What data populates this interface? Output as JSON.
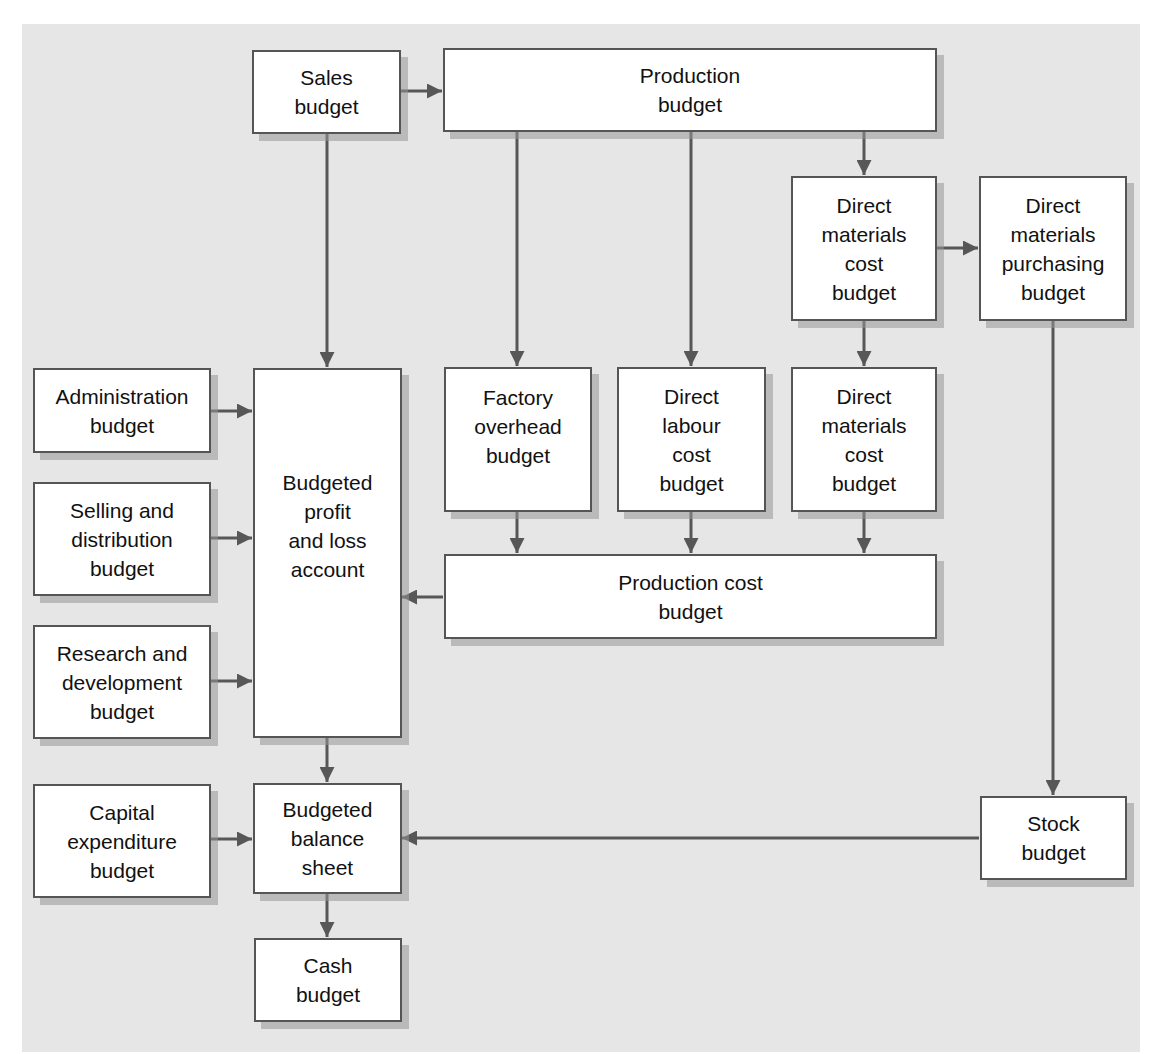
{
  "diagram": {
    "type": "flowchart",
    "colors": {
      "panel_background": "#e6e6e6",
      "box_fill": "#ffffff",
      "box_border": "#555555",
      "arrow": "#575757",
      "text": "#111111"
    },
    "nodes": {
      "sales": "Sales\nbudget",
      "production": "Production\nbudget",
      "dm_cost_top": "Direct\nmaterials\ncost\nbudget",
      "dm_purchasing": "Direct\nmaterials\npurchasing\nbudget",
      "administration": "Administration\nbudget",
      "selling_distribution": "Selling and\ndistribution\nbudget",
      "research_development": "Research and\ndevelopment\nbudget",
      "profit_loss": "Budgeted\nprofit\nand loss\naccount",
      "factory_overhead": "Factory\noverhead\nbudget",
      "direct_labour": "Direct\nlabour\ncost\nbudget",
      "dm_cost_bottom": "Direct\nmaterials\ncost\nbudget",
      "production_cost": "Production cost\nbudget",
      "capital_expenditure": "Capital\nexpenditure\nbudget",
      "balance_sheet": "Budgeted\nbalance\nsheet",
      "cash": "Cash\nbudget",
      "stock": "Stock\nbudget"
    },
    "edges": [
      {
        "from": "sales",
        "to": "production"
      },
      {
        "from": "sales",
        "to": "profit_loss"
      },
      {
        "from": "production",
        "to": "factory_overhead"
      },
      {
        "from": "production",
        "to": "direct_labour"
      },
      {
        "from": "production",
        "to": "dm_cost_top"
      },
      {
        "from": "dm_cost_top",
        "to": "dm_purchasing"
      },
      {
        "from": "dm_cost_top",
        "to": "dm_cost_bottom"
      },
      {
        "from": "dm_purchasing",
        "to": "stock"
      },
      {
        "from": "administration",
        "to": "profit_loss"
      },
      {
        "from": "selling_distribution",
        "to": "profit_loss"
      },
      {
        "from": "research_development",
        "to": "profit_loss"
      },
      {
        "from": "factory_overhead",
        "to": "production_cost"
      },
      {
        "from": "direct_labour",
        "to": "production_cost"
      },
      {
        "from": "dm_cost_bottom",
        "to": "production_cost"
      },
      {
        "from": "production_cost",
        "to": "profit_loss"
      },
      {
        "from": "profit_loss",
        "to": "balance_sheet"
      },
      {
        "from": "capital_expenditure",
        "to": "balance_sheet"
      },
      {
        "from": "stock",
        "to": "balance_sheet"
      },
      {
        "from": "balance_sheet",
        "to": "cash"
      }
    ]
  }
}
